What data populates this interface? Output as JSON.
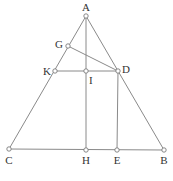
{
  "diagram": {
    "type": "geometry",
    "colors": {
      "line": "#8a8a8a",
      "point_stroke": "#7a7a7a",
      "point_fill": "#ffffff",
      "label": "#333333",
      "background": "#ffffff"
    },
    "points": [
      {
        "id": "A",
        "label": "A",
        "x": 86,
        "y": 16,
        "lx": 86,
        "ly": 11,
        "anchor": "middle"
      },
      {
        "id": "G",
        "label": "G",
        "x": 68,
        "y": 46,
        "lx": 63,
        "ly": 48,
        "anchor": "end"
      },
      {
        "id": "K",
        "label": "K",
        "x": 55,
        "y": 71,
        "lx": 51,
        "ly": 75,
        "anchor": "end"
      },
      {
        "id": "I",
        "label": "I",
        "x": 86,
        "y": 71,
        "lx": 89,
        "ly": 84,
        "anchor": "start"
      },
      {
        "id": "D",
        "label": "D",
        "x": 118,
        "y": 71,
        "lx": 122,
        "ly": 73,
        "anchor": "start"
      },
      {
        "id": "C",
        "label": "C",
        "x": 9,
        "y": 149,
        "lx": 9,
        "ly": 164,
        "anchor": "middle"
      },
      {
        "id": "H",
        "label": "H",
        "x": 86,
        "y": 150,
        "lx": 86,
        "ly": 164,
        "anchor": "middle"
      },
      {
        "id": "E",
        "label": "E",
        "x": 117,
        "y": 150,
        "lx": 117,
        "ly": 164,
        "anchor": "middle"
      },
      {
        "id": "B",
        "label": "B",
        "x": 164,
        "y": 150,
        "lx": 164,
        "ly": 164,
        "anchor": "middle"
      }
    ],
    "segments": [
      [
        "A",
        "C"
      ],
      [
        "A",
        "B"
      ],
      [
        "C",
        "B"
      ],
      [
        "A",
        "H"
      ],
      [
        "K",
        "D"
      ],
      [
        "G",
        "D"
      ],
      [
        "D",
        "E"
      ]
    ]
  }
}
